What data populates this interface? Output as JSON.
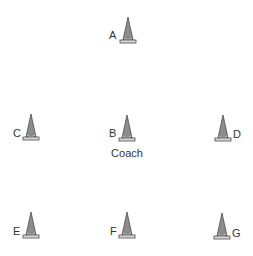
{
  "diagram": {
    "cones": [
      {
        "id": "A",
        "label": "A",
        "x": 119,
        "y": 16,
        "label_side": "left"
      },
      {
        "id": "B",
        "label": "B",
        "x": 118,
        "y": 114,
        "label_side": "left"
      },
      {
        "id": "C",
        "label": "C",
        "x": 22,
        "y": 113,
        "label_side": "left"
      },
      {
        "id": "D",
        "label": "D",
        "x": 214,
        "y": 114,
        "label_side": "right"
      },
      {
        "id": "E",
        "label": "E",
        "x": 22,
        "y": 211,
        "label_side": "left"
      },
      {
        "id": "F",
        "label": "F",
        "x": 118,
        "y": 211,
        "label_side": "left"
      },
      {
        "id": "G",
        "label": "G",
        "x": 213,
        "y": 212,
        "label_side": "right"
      }
    ],
    "caption": "Coach",
    "colors": {
      "cone_fill": "#8c8c8c",
      "cone_stroke": "#4d4d4d",
      "base_fill": "#d9d9d9",
      "text": "#333333"
    }
  }
}
